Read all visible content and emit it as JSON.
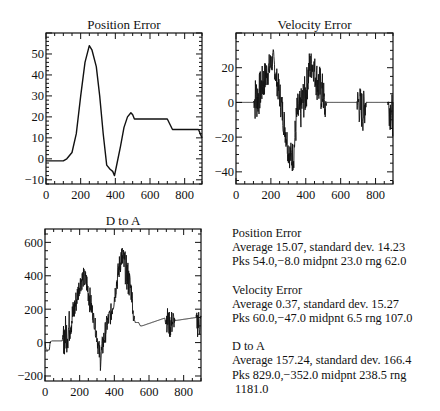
{
  "chart_data": [
    {
      "type": "line",
      "title": "Position Error",
      "xlabel": "",
      "ylabel": "",
      "xlim": [
        0,
        900
      ],
      "ylim": [
        -12,
        60
      ],
      "xticks": [
        0,
        200,
        400,
        600,
        800
      ],
      "yticks": [
        -10,
        0,
        10,
        20,
        30,
        40,
        50
      ],
      "grid": false,
      "box": {
        "x": 46,
        "y": 33,
        "w": 156,
        "h": 151
      },
      "noisy": false,
      "series": [
        {
          "name": "Position Error",
          "x": [
            0,
            100,
            120,
            150,
            175,
            200,
            225,
            250,
            265,
            290,
            310,
            330,
            350,
            370,
            385,
            395,
            410,
            430,
            450,
            470,
            490,
            500,
            510,
            520,
            700,
            730,
            880,
            890,
            900
          ],
          "y": [
            -1,
            -1,
            0,
            3,
            12,
            30,
            46,
            54,
            52,
            44,
            30,
            12,
            -3,
            -5,
            -6,
            -8,
            -2,
            6,
            15,
            20,
            22,
            21,
            19,
            19,
            19,
            14,
            14,
            12,
            10
          ]
        }
      ]
    },
    {
      "type": "line",
      "title": "Velocity Error",
      "xlabel": "",
      "ylabel": "",
      "xlim": [
        0,
        900
      ],
      "ylim": [
        -47,
        40
      ],
      "xticks": [
        0,
        200,
        400,
        600,
        800
      ],
      "yticks": [
        -40,
        -20,
        0,
        20
      ],
      "grid": false,
      "box": {
        "x": 236,
        "y": 33,
        "w": 157,
        "h": 151
      },
      "noisy": true,
      "series": [
        {
          "name": "Velocity Error",
          "x": [
            0,
            100,
            110,
            130,
            150,
            170,
            200,
            215,
            230,
            250,
            270,
            290,
            300,
            320,
            330,
            350,
            370,
            380,
            400,
            420,
            440,
            460,
            480,
            500,
            510,
            520,
            700,
            720,
            730,
            740,
            870,
            880,
            900
          ],
          "y": [
            0,
            0,
            2,
            4,
            10,
            15,
            22,
            25,
            14,
            5,
            -8,
            -20,
            -28,
            -32,
            -30,
            -6,
            -5,
            0,
            5,
            20,
            22,
            14,
            8,
            5,
            -5,
            0,
            0,
            -4,
            -6,
            0,
            0,
            -3,
            -8
          ]
        },
        {
          "name": "noise-amplitude",
          "x": [
            0,
            100,
            110,
            200,
            210,
            260,
            300,
            330,
            360,
            400,
            440,
            480,
            505,
            520,
            690,
            700,
            740,
            750,
            870,
            880,
            900
          ],
          "y": [
            0,
            0,
            14,
            8,
            6,
            10,
            8,
            10,
            12,
            12,
            8,
            14,
            10,
            0,
            0,
            12,
            12,
            0,
            0,
            12,
            12
          ]
        }
      ]
    },
    {
      "type": "line",
      "title": "D to A",
      "xlabel": "",
      "ylabel": "",
      "xlim": [
        0,
        900
      ],
      "ylim": [
        -230,
        680
      ],
      "xticks": [
        0,
        200,
        400,
        600,
        800
      ],
      "yticks": [
        -200,
        0,
        200,
        400,
        600
      ],
      "grid": false,
      "box": {
        "x": 45,
        "y": 229,
        "w": 156,
        "h": 152
      },
      "noisy": true,
      "series": [
        {
          "name": "D to A",
          "x": [
            0,
            5,
            10,
            25,
            30,
            40,
            100,
            110,
            130,
            150,
            170,
            200,
            220,
            240,
            260,
            280,
            300,
            310,
            320,
            340,
            360,
            380,
            400,
            420,
            440,
            460,
            480,
            500,
            510,
            520,
            540,
            550,
            560,
            700,
            720,
            740,
            870,
            880,
            900
          ],
          "y": [
            5,
            -40,
            -45,
            -45,
            5,
            10,
            10,
            40,
            60,
            130,
            200,
            350,
            390,
            360,
            250,
            150,
            40,
            -40,
            -100,
            20,
            120,
            170,
            270,
            400,
            520,
            460,
            380,
            300,
            160,
            120,
            120,
            100,
            100,
            150,
            100,
            130,
            150,
            120,
            110
          ]
        },
        {
          "name": "noise-amplitude",
          "x": [
            0,
            99,
            100,
            110,
            200,
            210,
            260,
            280,
            300,
            330,
            360,
            400,
            440,
            480,
            510,
            520,
            690,
            700,
            740,
            750,
            870,
            880,
            900
          ],
          "y": [
            0,
            0,
            0,
            130,
            60,
            60,
            80,
            40,
            60,
            80,
            60,
            60,
            80,
            110,
            40,
            0,
            0,
            80,
            80,
            0,
            0,
            90,
            90
          ]
        }
      ]
    }
  ],
  "stats": [
    {
      "title": "Position Error",
      "lines": [
        "Average 15.07, standard dev. 14.23",
        "Pks 54.0,−8.0 midpnt 23.0 rng 62.0"
      ]
    },
    {
      "title": "Velocity Error",
      "lines": [
        "Average 0.37, standard dev. 15.27",
        "Pks 60.0,−47.0 midpnt 6.5 rng 107.0"
      ]
    },
    {
      "title": "D to A",
      "lines": [
        "Average 157.24, standard dev. 166.4",
        "Pks 829.0,−352.0 midpnt 238.5 rng",
        " 1181.0"
      ]
    }
  ]
}
